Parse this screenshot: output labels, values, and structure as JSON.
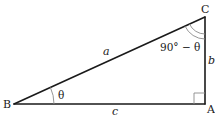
{
  "diagram": {
    "type": "right-triangle",
    "vertices": {
      "A": {
        "label": "A",
        "note": "right angle"
      },
      "B": {
        "label": "B"
      },
      "C": {
        "label": "C"
      }
    },
    "sides": {
      "a": {
        "label": "a",
        "between": "B-C",
        "role": "hypotenuse"
      },
      "b": {
        "label": "b",
        "between": "C-A"
      },
      "c": {
        "label": "c",
        "between": "B-A"
      }
    },
    "angles": {
      "B": {
        "label": "θ"
      },
      "C": {
        "label": "90° − θ"
      },
      "A": {
        "label": "",
        "marker": "right-angle-square"
      }
    },
    "colors": {
      "edge": "#1a1a1a",
      "angle_mark": "#8a8a8a",
      "background": "#ffffff"
    }
  }
}
